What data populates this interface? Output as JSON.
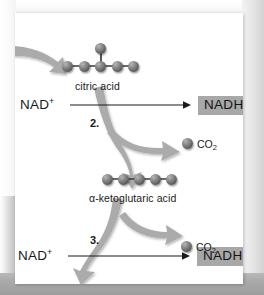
{
  "diagram": {
    "background_color": "#ffffff",
    "card_color": "#ffffff",
    "accent_box_color": "#a8a8a8",
    "arrow_color": "#a9a9a9",
    "sphere_color": "#6b6b6b"
  },
  "molecules": [
    {
      "id": "citric-acid",
      "label": "citric acid",
      "carbon_count": 6,
      "shape": "five-in-row-plus-one-above-center"
    },
    {
      "id": "alpha-ketoglutaric-acid",
      "label": "α-ketoglutaric acid",
      "carbon_count": 5,
      "shape": "five-in-row"
    }
  ],
  "steps": [
    {
      "number": "2.",
      "reactant_label": "NAD",
      "reactant_charge": "+",
      "product_label": "NADH",
      "byproduct_label": "CO",
      "byproduct_sub": "2"
    },
    {
      "number": "3.",
      "reactant_label": "NAD",
      "reactant_charge": "+",
      "product_label": "NADH",
      "byproduct_label": "CO",
      "byproduct_sub": "2"
    }
  ],
  "labels": {
    "citric_acid": "citric acid",
    "alpha_ketoglutaric_acid": "α-ketoglutaric acid",
    "nad_plus_1": "NAD",
    "nad_plus_sup_1": "+",
    "nadh_1": "NADH",
    "co2_1": "CO",
    "co2_1_sub": "2",
    "step_2": "2.",
    "nad_plus_2": "NAD",
    "nad_plus_sup_2": "+",
    "nadh_2": "NADH",
    "co2_2": "CO",
    "co2_2_sub": "2",
    "step_3": "3."
  }
}
